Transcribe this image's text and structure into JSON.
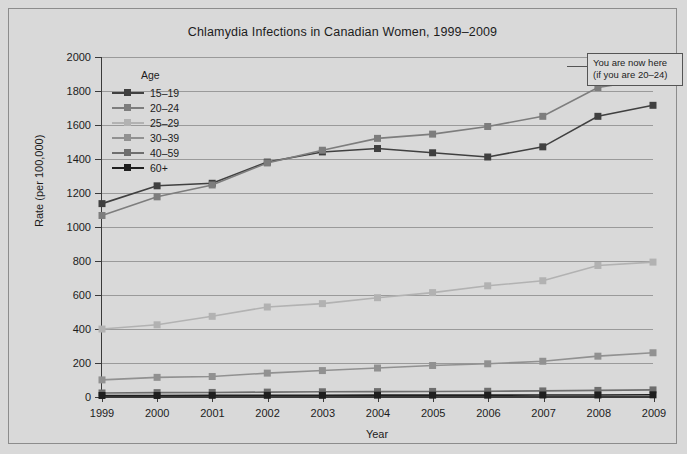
{
  "chart_data": {
    "type": "line",
    "title": "Chlamydia Infections in Canadian Women, 1999–2009",
    "xlabel": "Year",
    "ylabel": "Rate (per 100,000)",
    "categories": [
      "1999",
      "2000",
      "2001",
      "2002",
      "2003",
      "2004",
      "2005",
      "2006",
      "2007",
      "2008",
      "2009"
    ],
    "x": [
      1999,
      2000,
      2001,
      2002,
      2003,
      2004,
      2005,
      2006,
      2007,
      2008,
      2009
    ],
    "ylim": [
      0,
      2000
    ],
    "yticks": [
      0,
      200,
      400,
      600,
      800,
      1000,
      1200,
      1400,
      1600,
      1800,
      2000
    ],
    "grid": true,
    "legend_position": "upper-left-inside",
    "legend_title": "Age",
    "series": [
      {
        "name": "15–19",
        "color": "#404040",
        "values": [
          1135,
          1240,
          1255,
          1380,
          1440,
          1460,
          1435,
          1410,
          1470,
          1650,
          1715
        ]
      },
      {
        "name": "20–24",
        "color": "#7d7d7d",
        "values": [
          1065,
          1175,
          1245,
          1375,
          1450,
          1520,
          1545,
          1590,
          1650,
          1820,
          1870
        ]
      },
      {
        "name": "25–29",
        "color": "#b2b2b2",
        "values": [
          395,
          420,
          470,
          525,
          545,
          580,
          610,
          650,
          680,
          770,
          790
        ]
      },
      {
        "name": "30–39",
        "color": "#919191",
        "values": [
          95,
          110,
          115,
          135,
          150,
          165,
          180,
          190,
          205,
          235,
          255
        ]
      },
      {
        "name": "40–59",
        "color": "#6e6e6e",
        "values": [
          18,
          20,
          21,
          23,
          25,
          26,
          27,
          28,
          30,
          33,
          36
        ]
      },
      {
        "name": "60+",
        "color": "#1f1f1f",
        "values": [
          3,
          3,
          4,
          4,
          4,
          5,
          5,
          5,
          6,
          6,
          7
        ]
      }
    ]
  },
  "annotation": {
    "line1": "You are now here",
    "line2": "(if you are 20–24)"
  }
}
